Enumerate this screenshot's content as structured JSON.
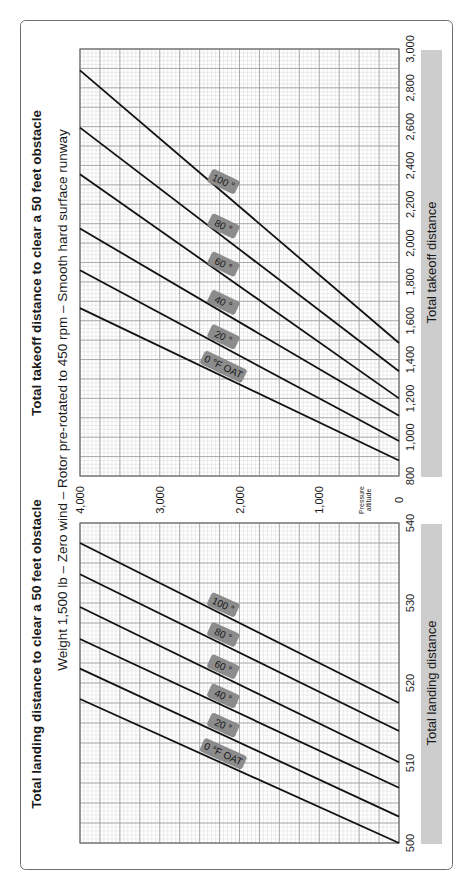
{
  "frame": {
    "border_color": "#6e6e6e",
    "background": "#ffffff"
  },
  "colors": {
    "grid_minor": "#d9d9d9",
    "grid_major": "#9a9a9a",
    "axis": "#6e6e6e",
    "line": "#111111",
    "axis_title_bar": "#cdcdcd",
    "badge_fill": "#8c8c8c",
    "badge_text": "#1a1a1a",
    "text": "#1a1a1a"
  },
  "subtitle": "Weight 1,500 lb – Zero wind – Rotor pre-rotated to 450 rpm – Smooth hard surface runway",
  "shared_axis": {
    "label": "Pressure altitude",
    "label_line1": "Pressure",
    "label_line2": "altitude",
    "ticks": [
      "0",
      "1,000",
      "2,000",
      "3,000",
      "4,000"
    ]
  },
  "chart_data": [
    {
      "type": "line",
      "title": "Total takeoff distance to clear a 50 feet obstacle",
      "subtitle": "Weight 1,500 lb – Zero wind – Rotor pre-rotated to 450 rpm – Smooth hard surface runway",
      "xlabel": "Total takeoff distance",
      "ylabel": "Pressure altitude",
      "xlim": [
        800,
        3000
      ],
      "ylim": [
        0,
        4000
      ],
      "x_ticks": [
        "800",
        "1,000",
        "1,200",
        "1,400",
        "1,600",
        "1,800",
        "2,000",
        "2,200",
        "2,400",
        "2,600",
        "2,800",
        "3,000"
      ],
      "y_ticks": [
        "0",
        "1,000",
        "2,000",
        "3,000",
        "4,000"
      ],
      "grid": true,
      "legend": "inline badges on lines (OAT °F)",
      "series": [
        {
          "name": "0 °F OAT",
          "label": "0 °F OAT",
          "x": [
            880,
            1665
          ],
          "y": [
            0,
            4000
          ]
        },
        {
          "name": "20 °F",
          "label": "20 °",
          "x": [
            980,
            1860
          ],
          "y": [
            0,
            4000
          ]
        },
        {
          "name": "40 °F",
          "label": "40 °",
          "x": [
            1110,
            2075
          ],
          "y": [
            0,
            4000
          ]
        },
        {
          "name": "60 °F",
          "label": "60 °",
          "x": [
            1200,
            2355
          ],
          "y": [
            0,
            4000
          ]
        },
        {
          "name": "80 °F",
          "label": "80 °",
          "x": [
            1340,
            2595
          ],
          "y": [
            0,
            4000
          ]
        },
        {
          "name": "100 °F",
          "label": "100 °",
          "x": [
            1485,
            2890
          ],
          "y": [
            0,
            4000
          ]
        }
      ]
    },
    {
      "type": "line",
      "title": "Total landing distance to clear a 50 feet obstacle",
      "subtitle": "Weight 1,500 lb – Zero wind",
      "xlabel": "Total landing distance",
      "ylabel": "Pressure altitude",
      "xlim": [
        500,
        540
      ],
      "ylim": [
        0,
        4000
      ],
      "x_ticks": [
        "500",
        "510",
        "520",
        "530",
        "540"
      ],
      "y_ticks": [
        "0",
        "1,000",
        "2,000",
        "3,000",
        "4,000"
      ],
      "grid": true,
      "legend": "inline badges on lines (OAT °F)",
      "series": [
        {
          "name": "0 °F OAT",
          "label": "0 °F OAT",
          "x": [
            500,
            518
          ],
          "y": [
            0,
            4000
          ]
        },
        {
          "name": "20 °F",
          "label": "20 °",
          "x": [
            503.3,
            521.8
          ],
          "y": [
            0,
            4000
          ]
        },
        {
          "name": "40 °F",
          "label": "40 °",
          "x": [
            506.9,
            525.5
          ],
          "y": [
            0,
            4000
          ]
        },
        {
          "name": "60 °F",
          "label": "60 °",
          "x": [
            510.1,
            529.5
          ],
          "y": [
            0,
            4000
          ]
        },
        {
          "name": "80 °F",
          "label": "80 °",
          "x": [
            514,
            533.6
          ],
          "y": [
            0,
            4000
          ]
        },
        {
          "name": "100 °F",
          "label": "100 °",
          "x": [
            517.5,
            537.5
          ],
          "y": [
            0,
            4000
          ]
        }
      ]
    }
  ]
}
